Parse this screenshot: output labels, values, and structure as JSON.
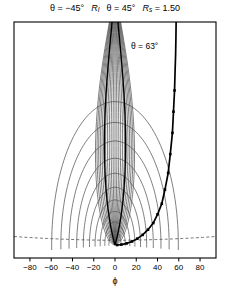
{
  "figure": {
    "title_parts": [
      {
        "text": "θ = −45°"
      },
      {
        "text": "R",
        "sub": "I"
      },
      {
        "text": "θ = 45°"
      },
      {
        "text": "R",
        "sub": "s",
        "tail": " = 1.50"
      }
    ],
    "annotation": "θ = 63°",
    "xlabel": "ϕ",
    "frame_color": "#000000",
    "grid_color": "#555555",
    "highlight_color": "#000000"
  },
  "chart_data": {
    "type": "line",
    "xlabel": "ϕ",
    "ylabel": "",
    "xlim": [
      -95,
      95
    ],
    "ylim": [
      0,
      1
    ],
    "xticks": [
      -80,
      -60,
      -40,
      -20,
      0,
      20,
      40,
      60,
      80
    ],
    "xticklabels": [
      "−80",
      "−60",
      "−40",
      "−20",
      "0",
      "20",
      "40",
      "60",
      "80"
    ],
    "yticks": [],
    "grid": true,
    "legend": null,
    "annotations": [
      {
        "text": "θ = 63°",
        "x": 30,
        "y": 0.86
      },
      {
        "text": "R_I",
        "x": -8,
        "y": 1.04
      },
      {
        "text": "R_s = 1.50",
        "x": 55,
        "y": 1.04
      }
    ],
    "focus": {
      "x": 0,
      "y": 0.055
    },
    "ray_angles_deg": [
      -88,
      -80,
      -72,
      -64,
      -56,
      -48,
      -40,
      -32,
      -24,
      -16,
      -8,
      0,
      8,
      16,
      24,
      32,
      40,
      48,
      56,
      64,
      72,
      80,
      88
    ],
    "highlight_rays_deg": [
      -45,
      45
    ],
    "arc_radii": [
      0.06,
      0.1,
      0.145,
      0.195,
      0.25,
      0.31,
      0.375,
      0.45,
      0.53,
      0.62
    ],
    "dashed_curve": {
      "y": 0.075,
      "style": "dashed"
    },
    "marked_curve": {
      "label": "θ = 63°",
      "marker": "square",
      "points_x": [
        2,
        6,
        11,
        16,
        21,
        26,
        31,
        36,
        40,
        44,
        47,
        50,
        52,
        54,
        55,
        56,
        56.5,
        57,
        57.3,
        57.5
      ],
      "points_y": [
        0.055,
        0.057,
        0.062,
        0.07,
        0.082,
        0.098,
        0.12,
        0.148,
        0.185,
        0.23,
        0.29,
        0.36,
        0.44,
        0.53,
        0.62,
        0.71,
        0.79,
        0.86,
        0.93,
        1.0
      ]
    },
    "series": [
      {
        "name": "wavefront-arcs",
        "style": "solid",
        "color": "#555555"
      },
      {
        "name": "rays",
        "style": "solid",
        "color": "#555555"
      },
      {
        "name": "theta-63-caustic",
        "style": "solid-marked",
        "color": "#000000"
      },
      {
        "name": "asymptote",
        "style": "dashed",
        "color": "#555555"
      }
    ]
  }
}
